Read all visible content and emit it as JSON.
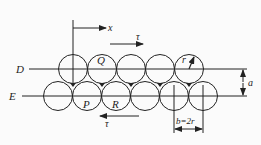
{
  "diagram": {
    "labels": {
      "line_upper": "D",
      "line_lower": "E",
      "axis_x": "x",
      "shear_top": "τ",
      "shear_bottom": "τ",
      "atom_q": "Q",
      "atom_p": "P",
      "atom_r": "R",
      "radius": "r",
      "spacing_vertical": "a",
      "spacing_horizontal": "b=2r"
    },
    "colors": {
      "stroke": "#222222",
      "background": "#fbfbfb"
    },
    "geometry": {
      "radius": 14.5,
      "upper_row_y": 69,
      "lower_row_y": 96,
      "upper_row_x": [
        73,
        102,
        131,
        160,
        189
      ],
      "lower_row_x": [
        58,
        87,
        116,
        145,
        174,
        203
      ]
    }
  }
}
